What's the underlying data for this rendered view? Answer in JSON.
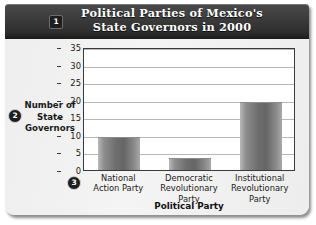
{
  "figure": {
    "title": "Political Parties of Mexico's\nState Governors in 2000",
    "callouts": [
      {
        "id": "1",
        "label": "1"
      },
      {
        "id": "2",
        "label": "2"
      },
      {
        "id": "3",
        "label": "3"
      }
    ],
    "colors": {
      "titlebar": "#2e2e2e",
      "title_text": "#ffffff",
      "bar_fill": "#6e6e6e",
      "grid": "#b8b8b8",
      "plot_background": "#ffffff",
      "card_background": "#f0f0f0",
      "axis": "#3a3a3a"
    }
  },
  "chart_data": {
    "type": "bar",
    "title": "Political Parties of Mexico's State Governors in 2000",
    "categories": [
      "National\nAction Party",
      "Democratic\nRevolutionary\nParty",
      "Institutional\nRevolutionary\nParty"
    ],
    "values": [
      9,
      3,
      19
    ],
    "xlabel": "Political Party",
    "ylabel": "Number of\nState\nGovernors",
    "ylim": [
      0,
      35
    ],
    "yticks": [
      0,
      5,
      10,
      15,
      20,
      25,
      30,
      35
    ],
    "ytick_labels": [
      "0",
      "5",
      "10",
      "15",
      "20",
      "25",
      "30",
      "35"
    ],
    "grid": true,
    "grid_axis": "y",
    "legend": false
  }
}
